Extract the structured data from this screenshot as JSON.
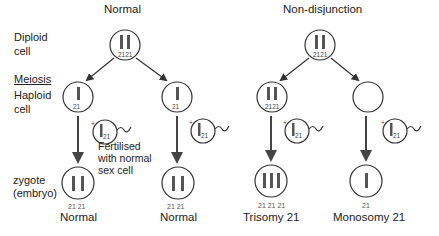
{
  "headings": {
    "normal": "Normal",
    "nondisjunction": "Non-disjunction"
  },
  "row_labels": {
    "diploid_line1": "Diploid",
    "diploid_line2": "cell",
    "meiosis": "Meiosis",
    "haploid_line1": "Haploid",
    "haploid_line2": "cell",
    "zygote_line1": "zygote",
    "zygote_line2": "(embryo)"
  },
  "fertilised_note": [
    "Fertilised",
    "with normal",
    "sex cell"
  ],
  "chromosome_label": "21",
  "plus": "+",
  "outcomes": {
    "normal_1": {
      "label": "Normal",
      "chromosomes": "21 21"
    },
    "normal_2": {
      "label": "Normal",
      "chromosomes": "21 21"
    },
    "trisomy": {
      "label": "Trisomy 21",
      "chromosomes": "21 21 21"
    },
    "monosomy": {
      "label": "Monosomy 21",
      "chromosomes": "21"
    }
  },
  "colors": {
    "line": "#333333",
    "chromosome": "#555555",
    "text": "#222222"
  }
}
